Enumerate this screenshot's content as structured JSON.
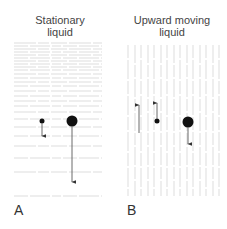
{
  "panels": [
    {
      "id": "A",
      "label": "A",
      "title_line1": "Stationary",
      "title_line2": "liquid",
      "streamline_orientation": "horizontal",
      "streamline_color": "#d4d4d4",
      "streamline_y": [
        43,
        46,
        49,
        52,
        55,
        58,
        61,
        64,
        67,
        70,
        74,
        78,
        82,
        86,
        91,
        96,
        101,
        106,
        112,
        119,
        127,
        136,
        146,
        158,
        172,
        196
      ],
      "particles": [
        {
          "name": "small-particle",
          "cx": 42,
          "cy": 121,
          "r": 2.5,
          "arrow": "down",
          "arrow_end_y": 136
        },
        {
          "name": "large-particle",
          "cx": 72,
          "cy": 121,
          "r": 5.5,
          "arrow": "down",
          "arrow_end_y": 182
        }
      ]
    },
    {
      "id": "B",
      "label": "B",
      "title_line1": "Upward moving",
      "title_line2": "liquid",
      "streamline_orientation": "vertical",
      "streamline_color": "#d4d4d4",
      "streamline_x": [
        128,
        135,
        141,
        148,
        154,
        161,
        167,
        174,
        180,
        187,
        193,
        200,
        206,
        213,
        219
      ],
      "fluid_arrow": {
        "name": "fluid-velocity-arrow",
        "x": 139,
        "y_start": 133,
        "y_end": 105,
        "direction": "up"
      },
      "particles": [
        {
          "name": "small-particle",
          "cx": 157,
          "cy": 121,
          "r": 2.5,
          "arrow": "up",
          "arrow_end_y": 103
        },
        {
          "name": "large-particle",
          "cx": 188,
          "cy": 122,
          "r": 5.5,
          "arrow": "down",
          "arrow_end_y": 144
        }
      ]
    }
  ],
  "colors": {
    "particle": "#111111",
    "arrow": "#444444",
    "text": "#444444"
  }
}
